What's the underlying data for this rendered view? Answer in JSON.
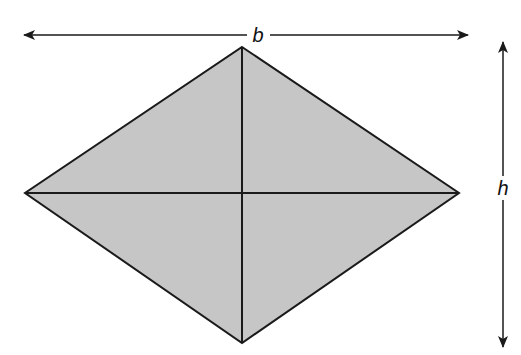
{
  "diagram": {
    "shape": "rhombus",
    "fill_color": "#c6c6c6",
    "stroke_color": "#1a1a1a",
    "labels": {
      "width": "b",
      "height": "h"
    },
    "vertices": {
      "top": [
        242,
        47
      ],
      "right": [
        459,
        193
      ],
      "bottom": [
        242,
        343
      ],
      "left": [
        25,
        193
      ]
    }
  }
}
